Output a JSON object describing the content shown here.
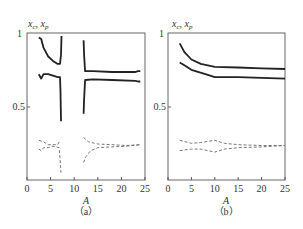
{
  "chart_data": [
    {
      "type": "line",
      "panel_label": "（a）",
      "ylabel": "x_c, x_p",
      "xlabel": "A",
      "xlim": [
        0,
        25
      ],
      "ylim": [
        0,
        1
      ],
      "xticks": [
        "0",
        "5",
        "10",
        "15",
        "20",
        "25"
      ],
      "yticks": [
        "0.5",
        "1"
      ],
      "grid": false,
      "series": [
        {
          "name": "upper solid (left branch)",
          "style": "solid",
          "points": [
            [
              2.5,
              0.97
            ],
            [
              3,
              0.96
            ],
            [
              3.5,
              0.9
            ],
            [
              4.5,
              0.84
            ],
            [
              5.5,
              0.81
            ],
            [
              6.5,
              0.79
            ],
            [
              7,
              0.79
            ],
            [
              7.2,
              0.85
            ],
            [
              7.3,
              0.98
            ]
          ]
        },
        {
          "name": "lower solid (left branch)",
          "style": "solid",
          "points": [
            [
              2.5,
              0.72
            ],
            [
              3,
              0.69
            ],
            [
              3.5,
              0.72
            ],
            [
              4.5,
              0.72
            ],
            [
              5.5,
              0.71
            ],
            [
              6.5,
              0.7
            ],
            [
              7,
              0.7
            ],
            [
              7.1,
              0.6
            ],
            [
              7.2,
              0.4
            ]
          ]
        },
        {
          "name": "upper solid (right branch)",
          "style": "solid",
          "points": [
            [
              12,
              0.95
            ],
            [
              12.1,
              0.85
            ],
            [
              12.3,
              0.74
            ],
            [
              14,
              0.74
            ],
            [
              18,
              0.735
            ],
            [
              23,
              0.735
            ],
            [
              23.5,
              0.74
            ],
            [
              24,
              0.74
            ]
          ]
        },
        {
          "name": "lower solid (right branch)",
          "style": "solid",
          "points": [
            [
              12,
              0.45
            ],
            [
              12.1,
              0.55
            ],
            [
              12.3,
              0.68
            ],
            [
              14,
              0.685
            ],
            [
              18,
              0.68
            ],
            [
              23,
              0.675
            ],
            [
              23.5,
              0.67
            ],
            [
              24,
              0.67
            ]
          ]
        },
        {
          "name": "upper dashed (left branch)",
          "style": "dashed",
          "points": [
            [
              2.5,
              0.27
            ],
            [
              3.5,
              0.26
            ],
            [
              4.5,
              0.24
            ],
            [
              5.5,
              0.24
            ],
            [
              6.5,
              0.24
            ],
            [
              7,
              0.27
            ]
          ]
        },
        {
          "name": "lower dashed (left branch)",
          "style": "dashed",
          "points": [
            [
              2.5,
              0.21
            ],
            [
              3,
              0.2
            ],
            [
              3.5,
              0.22
            ],
            [
              4.5,
              0.22
            ],
            [
              5.5,
              0.23
            ],
            [
              6.8,
              0.22
            ],
            [
              7,
              0.15
            ],
            [
              7.2,
              0.05
            ]
          ]
        },
        {
          "name": "upper dashed (right branch)",
          "style": "dashed",
          "points": [
            [
              12,
              0.29
            ],
            [
              13,
              0.26
            ],
            [
              15,
              0.245
            ],
            [
              18,
              0.24
            ],
            [
              21,
              0.235
            ],
            [
              24,
              0.24
            ]
          ]
        },
        {
          "name": "lower dashed (right branch)",
          "style": "dashed",
          "points": [
            [
              12,
              0.12
            ],
            [
              12.5,
              0.16
            ],
            [
              13.5,
              0.2
            ],
            [
              15,
              0.22
            ],
            [
              18,
              0.225
            ],
            [
              21,
              0.23
            ],
            [
              24,
              0.24
            ]
          ]
        }
      ]
    },
    {
      "type": "line",
      "panel_label": "（b）",
      "ylabel": "x_c, x_p",
      "xlabel": "A",
      "xlim": [
        0,
        25
      ],
      "ylim": [
        0,
        1
      ],
      "xticks": [
        "0",
        "5",
        "10",
        "15",
        "20",
        "25"
      ],
      "yticks": [
        "0.5",
        "1"
      ],
      "grid": false,
      "series": [
        {
          "name": "upper solid",
          "style": "solid",
          "points": [
            [
              2.5,
              0.93
            ],
            [
              3.5,
              0.87
            ],
            [
              5,
              0.82
            ],
            [
              7,
              0.79
            ],
            [
              10,
              0.77
            ],
            [
              15,
              0.765
            ],
            [
              20,
              0.76
            ],
            [
              25,
              0.755
            ]
          ]
        },
        {
          "name": "lower solid",
          "style": "solid",
          "points": [
            [
              2.5,
              0.8
            ],
            [
              3.5,
              0.78
            ],
            [
              5,
              0.75
            ],
            [
              8,
              0.72
            ],
            [
              10,
              0.7
            ],
            [
              15,
              0.7
            ],
            [
              20,
              0.695
            ],
            [
              25,
              0.69
            ]
          ]
        },
        {
          "name": "upper dashed",
          "style": "dashed",
          "points": [
            [
              2.5,
              0.27
            ],
            [
              5,
              0.25
            ],
            [
              7,
              0.255
            ],
            [
              10,
              0.27
            ],
            [
              12,
              0.25
            ],
            [
              15,
              0.24
            ],
            [
              20,
              0.235
            ],
            [
              25,
              0.235
            ]
          ]
        },
        {
          "name": "lower dashed",
          "style": "dashed",
          "points": [
            [
              2.5,
              0.2
            ],
            [
              5,
              0.21
            ],
            [
              7,
              0.21
            ],
            [
              10,
              0.19
            ],
            [
              12,
              0.21
            ],
            [
              15,
              0.22
            ],
            [
              20,
              0.225
            ],
            [
              25,
              0.235
            ]
          ]
        }
      ]
    }
  ],
  "labels": {
    "a": {
      "y1": "1",
      "y05": "0.5",
      "xt": [
        "0",
        "5",
        "10",
        "15",
        "20",
        "25"
      ],
      "xlabel": "A",
      "caption": "（a）",
      "ylab_main": "x",
      "ylab_sub1": "c",
      "ylab_sep": ", ",
      "ylab_main2": "x",
      "ylab_sub2": "p"
    },
    "b": {
      "y1": "1",
      "y05": "0.5",
      "xt": [
        "0",
        "5",
        "10",
        "15",
        "20",
        "25"
      ],
      "xlabel": "A",
      "caption": "（b）",
      "ylab_main": "x",
      "ylab_sub1": "c",
      "ylab_sep": ", ",
      "ylab_main2": "x",
      "ylab_sub2": "p"
    }
  },
  "colors": {
    "axis": "#555555",
    "solid": "#222222",
    "dashed": "#777777"
  }
}
